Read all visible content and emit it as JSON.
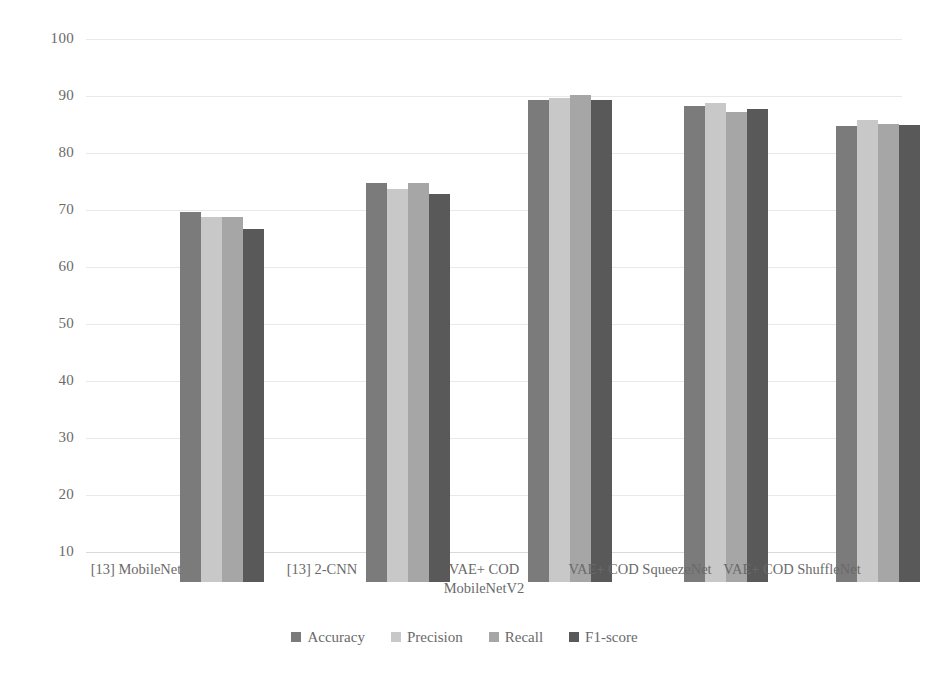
{
  "chart_data": {
    "type": "bar",
    "title": "",
    "subtitle": "",
    "xlabel": "",
    "ylabel": "",
    "ylim": [
      10,
      100
    ],
    "yticks": [
      100,
      90,
      80,
      70,
      60,
      50,
      40,
      30,
      20,
      10
    ],
    "grid": true,
    "legend_position": "bottom",
    "categories": [
      "[13] MobileNet",
      "[13] 2-CNN",
      "VAE+ COD\nMobileNetV2",
      "VAE+ COD SqueezeNet",
      "VAE+ COD ShuffleNet"
    ],
    "series": [
      {
        "name": "Accuracy",
        "color": "#7b7b7b",
        "values": [
          75.0,
          80.0,
          94.5,
          93.5,
          90.0
        ]
      },
      {
        "name": "Precision",
        "color": "#c8c8c8",
        "values": [
          74.0,
          79.0,
          95.0,
          94.0,
          91.0
        ]
      },
      {
        "name": "Recall",
        "color": "#a6a6a6",
        "values": [
          74.0,
          80.0,
          95.5,
          92.5,
          90.3
        ]
      },
      {
        "name": "F1-score",
        "color": "#595959",
        "values": [
          72.0,
          78.0,
          94.5,
          93.0,
          90.2
        ]
      }
    ]
  },
  "axis": {
    "y_tick_labels": [
      "100",
      "90",
      "80",
      "70",
      "60",
      "50",
      "40",
      "30",
      "20",
      "10"
    ]
  },
  "legend": {
    "items": [
      {
        "label": "Accuracy",
        "color": "#7b7b7b"
      },
      {
        "label": "Precision",
        "color": "#c8c8c8"
      },
      {
        "label": "Recall",
        "color": "#a6a6a6"
      },
      {
        "label": "F1-score",
        "color": "#595959"
      }
    ]
  }
}
